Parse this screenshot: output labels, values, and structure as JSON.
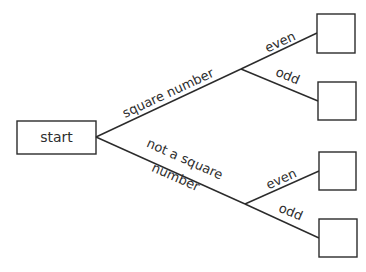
{
  "diagram": {
    "type": "tree-diagram",
    "root": {
      "label": "start"
    },
    "branches": [
      {
        "label": "square number",
        "children": [
          {
            "label": "even",
            "outcome": ""
          },
          {
            "label": "odd",
            "outcome": ""
          }
        ]
      },
      {
        "label_line1": "not a square",
        "label_line2": "number",
        "children": [
          {
            "label": "even",
            "outcome": ""
          },
          {
            "label": "odd",
            "outcome": ""
          }
        ]
      }
    ],
    "colors": {
      "line": "#2b2b2b",
      "text": "#2e2e2e",
      "background": "#ffffff"
    }
  }
}
